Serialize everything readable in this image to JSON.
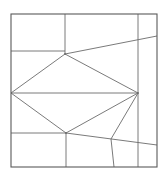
{
  "figure": {
    "width": 168,
    "height": 181,
    "background_color": "#ffffff",
    "stroke_color": "#6b6b6b",
    "border_color": "#5a5a5a",
    "stroke_width": 0.9,
    "border_width": 1.1
  },
  "frame": {
    "name": "outer-rectangle",
    "x": 11,
    "y": 14,
    "width": 146,
    "height": 153,
    "x2": 157,
    "y2": 167
  },
  "vertices": [
    {
      "id": "v-left-mid",
      "label": "left-middle-node",
      "x": 11,
      "y": 93,
      "on_border": true,
      "dot": false
    },
    {
      "id": "v-top-mid",
      "label": "upper-apex-node",
      "x": 65,
      "y": 54,
      "on_border": false,
      "dot": true
    },
    {
      "id": "v-hub-right",
      "label": "right-hub-node",
      "x": 138,
      "y": 93,
      "on_border": false,
      "dot": true
    },
    {
      "id": "v-bottom-mid",
      "label": "lower-apex-node",
      "x": 66,
      "y": 133,
      "on_border": false,
      "dot": true
    },
    {
      "id": "v-y-junction",
      "label": "lower-y-junction-node",
      "x": 111,
      "y": 139,
      "on_border": false,
      "dot": false
    },
    {
      "id": "v-right-top",
      "label": "right-edge-upper-node",
      "x": 157,
      "y": 36,
      "on_border": true,
      "dot": false
    },
    {
      "id": "v-right-low",
      "label": "right-edge-lower-node",
      "x": 157,
      "y": 145,
      "on_border": true,
      "dot": false
    },
    {
      "id": "v-bottom-edge",
      "label": "bottom-edge-node",
      "x": 114,
      "y": 167,
      "on_border": true,
      "dot": false
    },
    {
      "id": "v-top-edge",
      "label": "top-edge-node",
      "x": 65,
      "y": 14,
      "on_border": true,
      "dot": false
    },
    {
      "id": "v-bottom-left-e",
      "label": "bottom-edge-left-node",
      "x": 66,
      "y": 167,
      "on_border": true,
      "dot": false
    },
    {
      "id": "v-left-edge-up",
      "label": "left-edge-upper-node",
      "x": 11,
      "y": 51,
      "on_border": true,
      "dot": false
    },
    {
      "id": "v-left-edge-low",
      "label": "left-edge-lower-node",
      "x": 11,
      "y": 133,
      "on_border": true,
      "dot": false
    },
    {
      "id": "v-hub-top",
      "label": "hub-column-top-node",
      "x": 138,
      "y": 14,
      "on_border": true,
      "dot": false
    },
    {
      "id": "v-hub-bottom",
      "label": "hub-column-bottom-node",
      "x": 138,
      "y": 167,
      "on_border": true,
      "dot": false
    }
  ],
  "edges": [
    {
      "id": "e-grid-top-vertical",
      "label": "top-vertical-divider",
      "x1": 65,
      "y1": 14,
      "x2": 65,
      "y2": 54
    },
    {
      "id": "e-grid-upper-horiz",
      "label": "upper-left-horizontal",
      "x1": 11,
      "y1": 51,
      "x2": 65,
      "y2": 51
    },
    {
      "id": "e-grid-mid-horiz",
      "label": "middle-horizontal",
      "x1": 11,
      "y1": 93,
      "x2": 138,
      "y2": 93
    },
    {
      "id": "e-grid-lower-horiz",
      "label": "lower-left-horizontal",
      "x1": 11,
      "y1": 133,
      "x2": 66,
      "y2": 133
    },
    {
      "id": "e-grid-bottom-vertical",
      "label": "bottom-vertical-divider",
      "x1": 66,
      "y1": 133,
      "x2": 66,
      "y2": 167
    },
    {
      "id": "e-hub-column-upper",
      "label": "right-vertical-upper",
      "x1": 138,
      "y1": 14,
      "x2": 138,
      "y2": 93
    },
    {
      "id": "e-hub-column-lower",
      "label": "right-vertical-lower",
      "x1": 138,
      "y1": 93,
      "x2": 138,
      "y2": 167
    },
    {
      "id": "e-diag-left-up",
      "label": "left-to-upper-apex",
      "x1": 11,
      "y1": 93,
      "x2": 65,
      "y2": 54
    },
    {
      "id": "e-diag-left-down",
      "label": "left-to-lower-apex",
      "x1": 11,
      "y1": 93,
      "x2": 66,
      "y2": 133
    },
    {
      "id": "e-diag-up-hub",
      "label": "upper-apex-to-hub",
      "x1": 65,
      "y1": 54,
      "x2": 138,
      "y2": 93
    },
    {
      "id": "e-diag-down-hub",
      "label": "lower-apex-to-hub",
      "x1": 66,
      "y1": 133,
      "x2": 138,
      "y2": 93
    },
    {
      "id": "e-apex-to-right-top",
      "label": "upper-apex-to-right-edge",
      "x1": 65,
      "y1": 54,
      "x2": 157,
      "y2": 36
    },
    {
      "id": "e-hub-to-junction",
      "label": "hub-to-y-junction",
      "x1": 138,
      "y1": 93,
      "x2": 111,
      "y2": 139
    },
    {
      "id": "e-junction-to-bottom",
      "label": "y-junction-to-bottom",
      "x1": 111,
      "y1": 139,
      "x2": 114,
      "y2": 167
    },
    {
      "id": "e-apex-to-right-low",
      "label": "lower-apex-to-right-edge",
      "x1": 66,
      "y1": 133,
      "x2": 157,
      "y2": 145
    }
  ],
  "counts": {
    "vertex_count": 14,
    "edge_count": 15
  }
}
